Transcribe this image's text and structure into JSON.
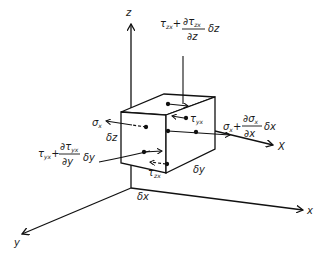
{
  "diagram": {
    "axes": {
      "z": "z",
      "x": "x",
      "y": "y",
      "X": "X"
    },
    "dimensions": {
      "dx": "δx",
      "dy": "δy",
      "dz": "δz"
    },
    "stresses": {
      "sigma_x": "σ",
      "sigma_x_sub": "x",
      "tau_yx": "τ",
      "tau_yx_sub": "yx",
      "tau_zx": "τ",
      "tau_zx_sub": "zx",
      "top_term": {
        "base": "τ",
        "base_sub": "zx",
        "plus": "+",
        "num": "∂τ",
        "num_sub": "zx",
        "den": "∂z",
        "tail": "δz"
      },
      "right_term": {
        "base": "σ",
        "base_sub": "x",
        "plus": "+",
        "num": "∂σ",
        "num_sub": "x",
        "den": "∂x",
        "tail": "δx"
      },
      "left_term": {
        "base": "τ",
        "base_sub": "yx",
        "plus": "+",
        "num": "∂τ",
        "num_sub": "yx",
        "den": "∂y",
        "tail": "δy"
      }
    }
  }
}
